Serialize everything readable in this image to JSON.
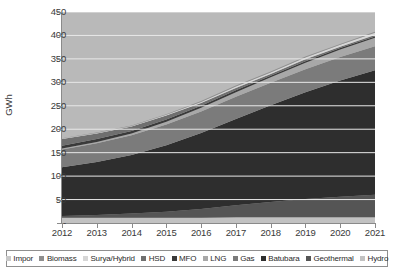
{
  "chart": {
    "y_axis_title": "GWh",
    "y_ticks": [
      "450",
      "400",
      "350",
      "300",
      "250",
      "200",
      "150",
      "100",
      "50",
      "-"
    ],
    "x_ticks": [
      "2012",
      "2013",
      "2014",
      "2015",
      "2016",
      "2017",
      "2018",
      "2019",
      "2020",
      "2021"
    ]
  },
  "legend": {
    "items": [
      {
        "label": "Impor",
        "color": "#c9c9c9"
      },
      {
        "label": "Biomass",
        "color": "#8e8e8e"
      },
      {
        "label": "Surya/Hybrid",
        "color": "#d6d6d6"
      },
      {
        "label": "HSD",
        "color": "#6f6f6f"
      },
      {
        "label": "MFO",
        "color": "#3a3a3a"
      },
      {
        "label": "LNG",
        "color": "#a8a8a8"
      },
      {
        "label": "Gas",
        "color": "#7b7b7b"
      },
      {
        "label": "Batubara",
        "color": "#2e2e2e"
      },
      {
        "label": "Geothermal",
        "color": "#555555"
      },
      {
        "label": "Hydro",
        "color": "#c2c2c2"
      }
    ]
  },
  "chart_data": {
    "type": "area",
    "stacked": true,
    "title": "",
    "xlabel": "",
    "ylabel": "GWh",
    "x": [
      2012,
      2013,
      2014,
      2015,
      2016,
      2017,
      2018,
      2019,
      2020,
      2021
    ],
    "xlim": [
      2012,
      2021
    ],
    "ylim": [
      0,
      450
    ],
    "ytick_values": [
      0,
      50,
      100,
      150,
      200,
      250,
      300,
      350,
      400,
      450
    ],
    "grid": "horizontal",
    "legend_position": "bottom",
    "series": [
      {
        "name": "Hydro",
        "color": "#c2c2c2",
        "values": [
          11,
          11,
          11,
          11,
          11,
          12,
          12,
          12,
          12,
          12
        ]
      },
      {
        "name": "Geothermal",
        "color": "#555555",
        "values": [
          4,
          6,
          9,
          13,
          19,
          26,
          33,
          39,
          44,
          48
        ]
      },
      {
        "name": "Batubara",
        "color": "#2e2e2e",
        "values": [
          104,
          113,
          125,
          142,
          162,
          184,
          206,
          228,
          248,
          266
        ]
      },
      {
        "name": "Gas",
        "color": "#7b7b7b",
        "values": [
          38,
          40,
          42,
          44,
          46,
          47,
          48,
          49,
          50,
          51
        ]
      },
      {
        "name": "LNG",
        "color": "#a8a8a8",
        "values": [
          2,
          3,
          4,
          6,
          8,
          10,
          12,
          14,
          16,
          18
        ]
      },
      {
        "name": "MFO",
        "color": "#3a3a3a",
        "values": [
          6,
          6,
          5,
          5,
          4,
          4,
          3,
          3,
          3,
          3
        ]
      },
      {
        "name": "HSD",
        "color": "#6f6f6f",
        "values": [
          14,
          12,
          10,
          8,
          6,
          5,
          4,
          4,
          3,
          3
        ]
      },
      {
        "name": "Surya/Hybrid",
        "color": "#d6d6d6",
        "values": [
          1,
          1,
          1,
          2,
          2,
          3,
          3,
          4,
          4,
          5
        ]
      },
      {
        "name": "Biomass",
        "color": "#8e8e8e",
        "values": [
          1,
          1,
          1,
          1,
          2,
          2,
          2,
          2,
          2,
          2
        ]
      },
      {
        "name": "Impor",
        "color": "#c9c9c9",
        "values": [
          0,
          0,
          0,
          0,
          0,
          0,
          0,
          0,
          0,
          0
        ]
      }
    ],
    "totals": [
      181,
      193,
      208,
      232,
      260,
      293,
      323,
      355,
      382,
      408
    ]
  }
}
